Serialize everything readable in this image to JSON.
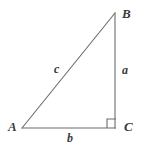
{
  "figure": {
    "kind": "right-triangle-diagram",
    "background_color": "#ffffff",
    "stroke_color": "#6b6b6b",
    "text_color": "#3a3a3a",
    "width": 152,
    "height": 156
  },
  "vertices": {
    "A": {
      "label": "A",
      "x": 22,
      "y": 128
    },
    "B": {
      "label": "B",
      "x": 115,
      "y": 13
    },
    "C": {
      "label": "C",
      "x": 115,
      "y": 128
    }
  },
  "sides": {
    "a": {
      "label": "a",
      "description": "vertical leg from B to C"
    },
    "b": {
      "label": "b",
      "description": "horizontal leg from A to C"
    },
    "c": {
      "label": "c",
      "description": "hypotenuse from A to B"
    }
  },
  "right_angle": {
    "at_vertex": "C",
    "marker": "right-angle-square"
  }
}
